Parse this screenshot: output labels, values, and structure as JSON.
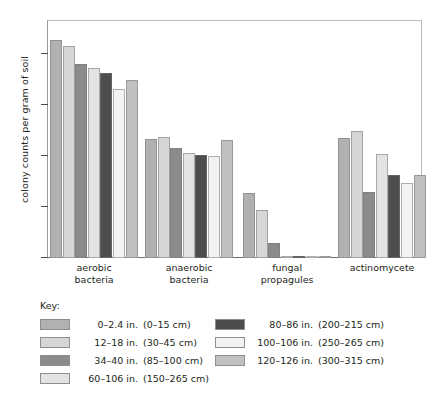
{
  "chart_data": {
    "type": "bar",
    "title": "",
    "subtitle": "",
    "xlabel": "",
    "ylabel": "colony counts per gram of soil",
    "yscale": "log",
    "ylim": [
      800,
      30000000
    ],
    "grid": false,
    "legend_position": "below-plot",
    "legend_title": "Key:",
    "categories": [
      "aerobic bacteria",
      "anaerobic bacteria",
      "fungal propagules",
      "actinomycete"
    ],
    "category_lines": [
      [
        "aerobic",
        "bacteria"
      ],
      [
        "anaerobic",
        "bacteria"
      ],
      [
        "fungal",
        "propagules"
      ],
      [
        "actinomycete",
        ""
      ]
    ],
    "ytick_labels": [
      "10⁷",
      "10⁶",
      "10⁵",
      "10⁴",
      "10³"
    ],
    "ytick_bases": [
      "10",
      "10",
      "10",
      "10",
      "10"
    ],
    "ytick_exponents": [
      "7",
      "6",
      "5",
      "4",
      "3"
    ],
    "ytick_values": [
      10000000,
      1000000,
      100000,
      10000,
      1000
    ],
    "series": [
      {
        "name": "0–2.4 in.",
        "metric": "(0–15 cm)",
        "color": "#b0b1b3",
        "values": [
          18000000,
          210000,
          18000,
          220000
        ]
      },
      {
        "name": "12–18 in.",
        "metric": "(30–45 cm)",
        "color": "#d5d6d8",
        "values": [
          14000000,
          230000,
          8500,
          290000
        ]
      },
      {
        "name": "34–40 in.",
        "metric": "(85–100 cm)",
        "color": "#8a8b8d",
        "values": [
          6000000,
          135000,
          1900,
          19000
        ]
      },
      {
        "name": "60–106 in.",
        "metric": "(150–265 cm)",
        "color": "#e2e3e5",
        "values": [
          5000000,
          110000,
          950,
          105000
        ]
      },
      {
        "name": "80–86 in.",
        "metric": "(200–215 cm)",
        "color": "#4c4d4f",
        "values": [
          4100000,
          100000,
          960,
          40000
        ]
      },
      {
        "name": "100–106 in.",
        "metric": "(250–265 cm)",
        "color": "#f2f2f1",
        "values": [
          1950000,
          95000,
          880,
          28000
        ]
      },
      {
        "name": "120–126 in.",
        "metric": "(300–315 cm)",
        "color": "#bfc0c2",
        "values": [
          2900000,
          200000,
          870,
          40000
        ]
      }
    ]
  }
}
